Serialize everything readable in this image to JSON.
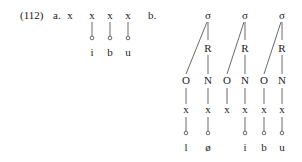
{
  "example_number": "(112)",
  "part_a": {
    "label": "a.",
    "skeleton": [
      {
        "slot": "x",
        "segment": ""
      },
      {
        "slot": "x",
        "segment": "i"
      },
      {
        "slot": "x",
        "segment": "b"
      },
      {
        "slot": "x",
        "segment": "u"
      }
    ]
  },
  "part_b": {
    "label": "b.",
    "syllables": [
      {
        "sigma": "σ",
        "rime": "R",
        "onset": {
          "node": "O",
          "slot": "x",
          "segment": "l"
        },
        "nucleus": {
          "node": "N",
          "slot": "x",
          "segment": "ø"
        }
      },
      {
        "sigma": "σ",
        "rime": "R",
        "onset": {
          "node": "O",
          "slot": "x",
          "segment": ""
        },
        "nucleus": {
          "node": "N",
          "slot": "x",
          "segment": "i"
        }
      },
      {
        "sigma": "σ",
        "rime": "R",
        "onset": {
          "node": "O",
          "slot": "x",
          "segment": "b"
        },
        "nucleus": {
          "node": "N",
          "slot": "x",
          "segment": "u"
        }
      }
    ]
  }
}
